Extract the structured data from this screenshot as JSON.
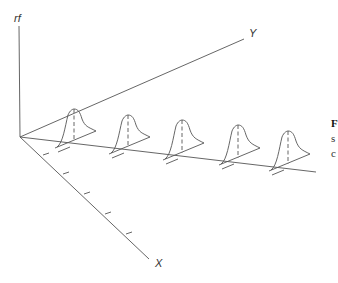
{
  "figure": {
    "axes": {
      "vertical_label": "rf",
      "y_label": "Y",
      "x_label": "X",
      "origin": [
        20,
        137
      ],
      "vertical_end": [
        19,
        26
      ],
      "y_end": [
        244,
        39
      ],
      "x_end": [
        149,
        259
      ],
      "baseline_end": [
        316,
        172
      ]
    },
    "x_ticks": [
      [
        43,
        155
      ],
      [
        63,
        174
      ],
      [
        84,
        194
      ],
      [
        105,
        214
      ],
      [
        126,
        234
      ]
    ],
    "curves": [
      {
        "peak": [
          74,
          109
        ],
        "base": [
          74,
          141
        ]
      },
      {
        "peak": [
          128,
          115
        ],
        "base": [
          128,
          147
        ]
      },
      {
        "peak": [
          182,
          120
        ],
        "base": [
          182,
          153
        ]
      },
      {
        "peak": [
          238,
          125
        ],
        "base": [
          238,
          158
        ]
      },
      {
        "peak": [
          288,
          131
        ],
        "base": [
          288,
          164
        ]
      }
    ],
    "colors": {
      "line": "#555555",
      "background": "#ffffff"
    }
  },
  "caption_fragments": {
    "line1": "F",
    "line2": "s",
    "line3": "c"
  }
}
